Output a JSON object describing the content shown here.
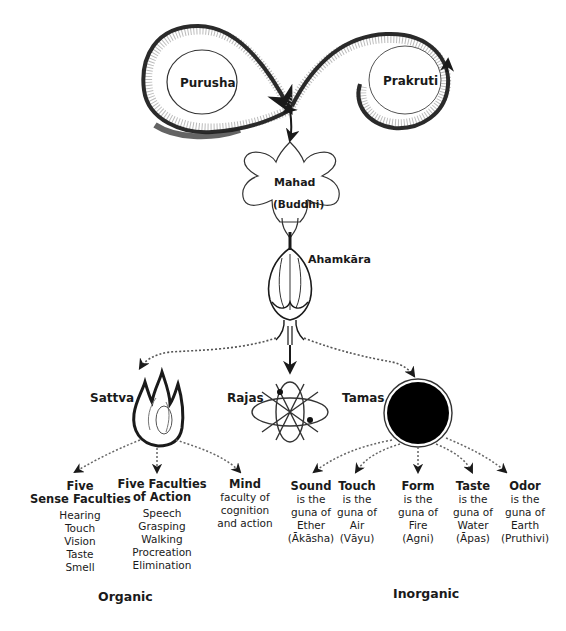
{
  "diagram": {
    "type": "cosmology flowchart (Samkhya evolution of creation)",
    "colors": {
      "ink": "#1a1a1a",
      "background": "#ffffff",
      "tamas_fill": "#000000"
    },
    "top": {
      "purusha": {
        "label": "Purusha"
      },
      "prakruti": {
        "label": "Prakruti"
      }
    },
    "mahad": {
      "label": "Mahad",
      "sublabel": "(Buddhi)"
    },
    "ahamkara": {
      "label": "Ahamkāra"
    },
    "gunas": {
      "sattva": {
        "label": "Sattva",
        "icon": "flame-icon"
      },
      "rajas": {
        "label": "Rajas",
        "icon": "atom-icon"
      },
      "tamas": {
        "label": "Tamas",
        "icon": "black-circle-icon"
      }
    },
    "organic": {
      "label": "Organic",
      "five_senses": {
        "title_line1": "Five",
        "title_line2": "Sense Faculties",
        "items": [
          "Hearing",
          "Touch",
          "Vision",
          "Taste",
          "Smell"
        ]
      },
      "five_actions": {
        "title_line1": "Five Faculties",
        "title_line2": "of Action",
        "items": [
          "Speech",
          "Grasping",
          "Walking",
          "Procreation",
          "Elimination"
        ]
      },
      "mind": {
        "title": "Mind",
        "lines": [
          "faculty of",
          "cognition",
          "and action"
        ]
      }
    },
    "inorganic": {
      "label": "Inorganic",
      "elements": [
        {
          "title": "Sound",
          "lines": [
            "is the",
            "guna of",
            "Ether",
            "(Ākāsha)"
          ]
        },
        {
          "title": "Touch",
          "lines": [
            "is the",
            "guna of",
            "Air",
            "(Vāyu)"
          ]
        },
        {
          "title": "Form",
          "lines": [
            "is the",
            "guna of",
            "Fire",
            "(Agni)"
          ]
        },
        {
          "title": "Taste",
          "lines": [
            "is the",
            "guna of",
            "Water",
            "(Āpas)"
          ]
        },
        {
          "title": "Odor",
          "lines": [
            "is the",
            "guna of",
            "Earth",
            "(Pruthivi)"
          ]
        }
      ]
    }
  }
}
